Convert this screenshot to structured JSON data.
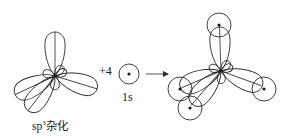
{
  "diagram": {
    "type": "orbital-hybridization",
    "left": {
      "label_prefix": "sp",
      "label_superscript": "3",
      "label_suffix": "杂化",
      "lobes": 4
    },
    "operator": "+4",
    "reactant": {
      "label": "1s",
      "symbol": "s-orbital-circle-with-nucleus"
    },
    "arrow": "right-arrow",
    "product": {
      "description": "sp3 hybrid orbitals overlapping with four 1s orbitals",
      "overlapping_circles": 4
    },
    "colors": {
      "stroke": "#2a2a2a",
      "background": "#ffffff"
    }
  }
}
